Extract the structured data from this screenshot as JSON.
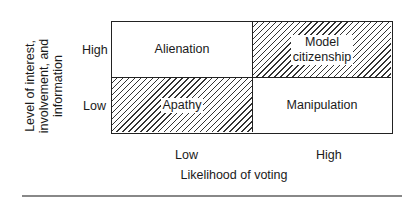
{
  "diagram": {
    "type": "2x2 matrix",
    "y_axis": {
      "label": "Level of interest, involvement, and information",
      "label_lines": [
        "Level of interest,",
        "involvement, and",
        "information"
      ],
      "ticks": [
        "High",
        "Low"
      ]
    },
    "x_axis": {
      "label": "Likelihood of voting",
      "ticks": [
        "Low",
        "High"
      ]
    },
    "cells": [
      {
        "row": "High",
        "col": "Low",
        "label": "Alienation",
        "hatched": false
      },
      {
        "row": "High",
        "col": "High",
        "label_lines": [
          "Model",
          "citizenship"
        ],
        "label": "Model citizenship",
        "hatched": true
      },
      {
        "row": "Low",
        "col": "Low",
        "label": "Apathy",
        "hatched": true
      },
      {
        "row": "Low",
        "col": "High",
        "label": "Manipulation",
        "hatched": false
      }
    ]
  }
}
